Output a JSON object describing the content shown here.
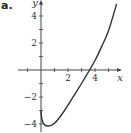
{
  "panel_label": "a.",
  "chart_data": {
    "type": "line",
    "title": "",
    "xlabel": "x",
    "ylabel": "y",
    "xlim": [
      -1.7,
      6.0
    ],
    "ylim": [
      -4.6,
      5.2
    ],
    "x_ticks": [
      -1,
      1,
      2,
      3,
      4,
      5
    ],
    "x_tick_labels": {
      "2": "2",
      "4": "4"
    },
    "y_ticks": [
      -4,
      -3,
      -2,
      -1,
      1,
      2,
      3,
      4
    ],
    "y_tick_labels": {
      "4": "4",
      "2": "2",
      "-2": "−2",
      "-4": "−4"
    },
    "grid": false,
    "series": [
      {
        "name": "f(x)",
        "x": [
          0,
          0.05,
          0.15,
          0.3,
          0.5,
          0.7,
          1.0,
          1.5,
          2.0,
          2.5,
          3.0,
          3.6,
          4.0,
          4.5,
          5.0,
          5.6
        ],
        "y": [
          -3.0,
          -3.55,
          -3.9,
          -4.08,
          -4.15,
          -4.12,
          -3.95,
          -3.35,
          -2.6,
          -1.8,
          -1.0,
          0.0,
          0.7,
          1.75,
          2.9,
          4.9
        ]
      }
    ]
  }
}
